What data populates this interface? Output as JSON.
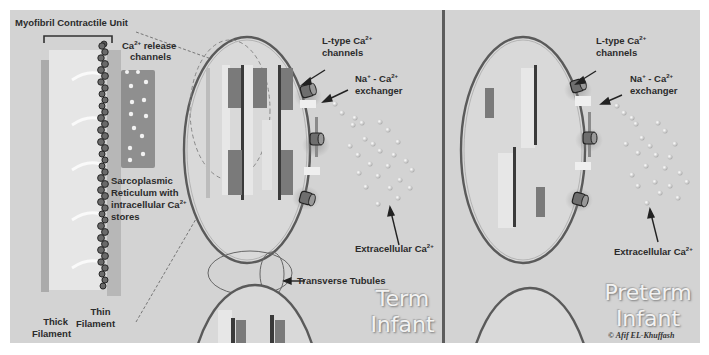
{
  "figure": {
    "background": "#d3d3d3",
    "panels": [
      {
        "id": "term",
        "title_line1": "Term",
        "title_line2": "Infant"
      },
      {
        "id": "preterm",
        "title_line1": "Preterm",
        "title_line2": "Infant"
      }
    ]
  },
  "labels": {
    "myofibril": "Myofibril Contractile Unit",
    "ca_release_1": "Ca",
    "ca_release_sup": "2+",
    "ca_release_2": " release",
    "ca_release_3": "channels",
    "sr_1": "Sarcoplasmic",
    "sr_2": "Reticulum with",
    "sr_3": "intracellular Ca",
    "sr_3_sup": "2+",
    "sr_4": "stores",
    "thick_1": "Thick",
    "thick_2": "Filament",
    "thin_1": "Thin",
    "thin_2": "Filament",
    "ltype_1": "L-type Ca",
    "ltype_sup": "2+",
    "ltype_2": "channels",
    "ncx_1": "Na",
    "ncx_sup1": "+",
    "ncx_mid": " - Ca",
    "ncx_sup2": "2+",
    "ncx_2": "exchanger",
    "extra_1": "Extracellular  Ca",
    "extra_sup": "2+",
    "ttubules": "Transverse Tubules"
  },
  "copyright": "© Afif EL-Khuffash"
}
